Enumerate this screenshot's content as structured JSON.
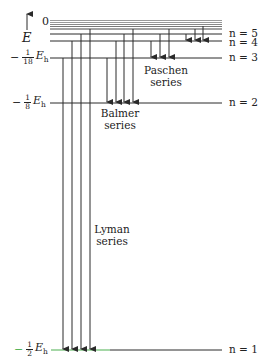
{
  "diagram": {
    "axis": {
      "label": "E",
      "zero_label": "0"
    },
    "levels": [
      {
        "n": "n = 5",
        "energy_label": null
      },
      {
        "n": "n = 4",
        "energy_label": null
      },
      {
        "n": "n = 3",
        "energy_label": {
          "sign": "−",
          "num": "1",
          "den": "18",
          "unit": "E",
          "sub": "h"
        }
      },
      {
        "n": "n = 2",
        "energy_label": {
          "sign": "−",
          "num": "1",
          "den": "8",
          "unit": "E",
          "sub": "h"
        }
      },
      {
        "n": "n = 1",
        "energy_label": {
          "sign": "−",
          "num": "1",
          "den": "2",
          "unit": "E",
          "sub": "h"
        }
      }
    ],
    "series": [
      {
        "name": "Lyman",
        "word": "series",
        "lower_level": 1,
        "line_count": 4
      },
      {
        "name": "Balmer",
        "word": "series",
        "lower_level": 2,
        "line_count": 4
      },
      {
        "name": "Paschen",
        "word": "series",
        "lower_level": 3,
        "line_count": 3
      }
    ],
    "colors": {
      "lines": "#2a2a2a",
      "ground_level_highlight": "#4caf50",
      "continuum": "#888888"
    }
  }
}
